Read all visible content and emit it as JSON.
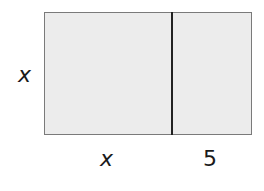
{
  "diagram": {
    "type": "area-model-rectangle",
    "side_label_left": "x",
    "bottom_labels": [
      "x",
      "5"
    ],
    "fill_color": "#ececec",
    "border_color": "#7a7a7a",
    "divider_color": "#222222"
  }
}
